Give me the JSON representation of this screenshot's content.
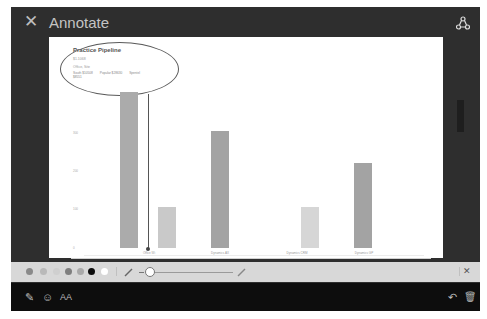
{
  "header": {
    "close_icon": "close-icon",
    "title": "Annotate",
    "share_icon": "share-icon"
  },
  "document": {
    "card_title": "Practice Pipeline",
    "card_subtitle": "$1.1068",
    "card_subtitle2": "Office, Site",
    "legend": [
      "South $10508",
      "Popular $28630",
      "Spentel $8551"
    ],
    "y_ticks": [
      "300",
      "200",
      "100",
      "0"
    ],
    "x_labels": [
      "Office Wi",
      "Dynamics AX",
      "Dynamics CRM",
      "Dynamics GP"
    ],
    "bars": [
      {
        "left": 71,
        "top": 55,
        "height": 156,
        "color": "#ababab"
      },
      {
        "left": 109,
        "top": 170,
        "height": 41,
        "color": "#c9c9c9"
      },
      {
        "left": 162,
        "top": 94,
        "height": 117,
        "color": "#a3a3a3"
      },
      {
        "left": 252,
        "top": 170,
        "height": 41,
        "color": "#d6d6d6"
      },
      {
        "left": 305,
        "top": 126,
        "height": 85,
        "color": "#a3a3a3"
      }
    ]
  },
  "toolbar": {
    "colors": [
      "#8a8a8a",
      "#b9b9b9",
      "#cfcfcf",
      "#7f7f7f",
      "#a9a9a9",
      "#0b0b0b",
      "#ffffff"
    ],
    "pen_icon": "pen-icon",
    "highlighter_icon": "highlighter-icon",
    "close_label": "✕"
  },
  "bottombar": {
    "pen_label": "✎",
    "emoji_label": "☺",
    "text_label": "AA",
    "undo_label": "↶",
    "trash_label": "🗑"
  }
}
